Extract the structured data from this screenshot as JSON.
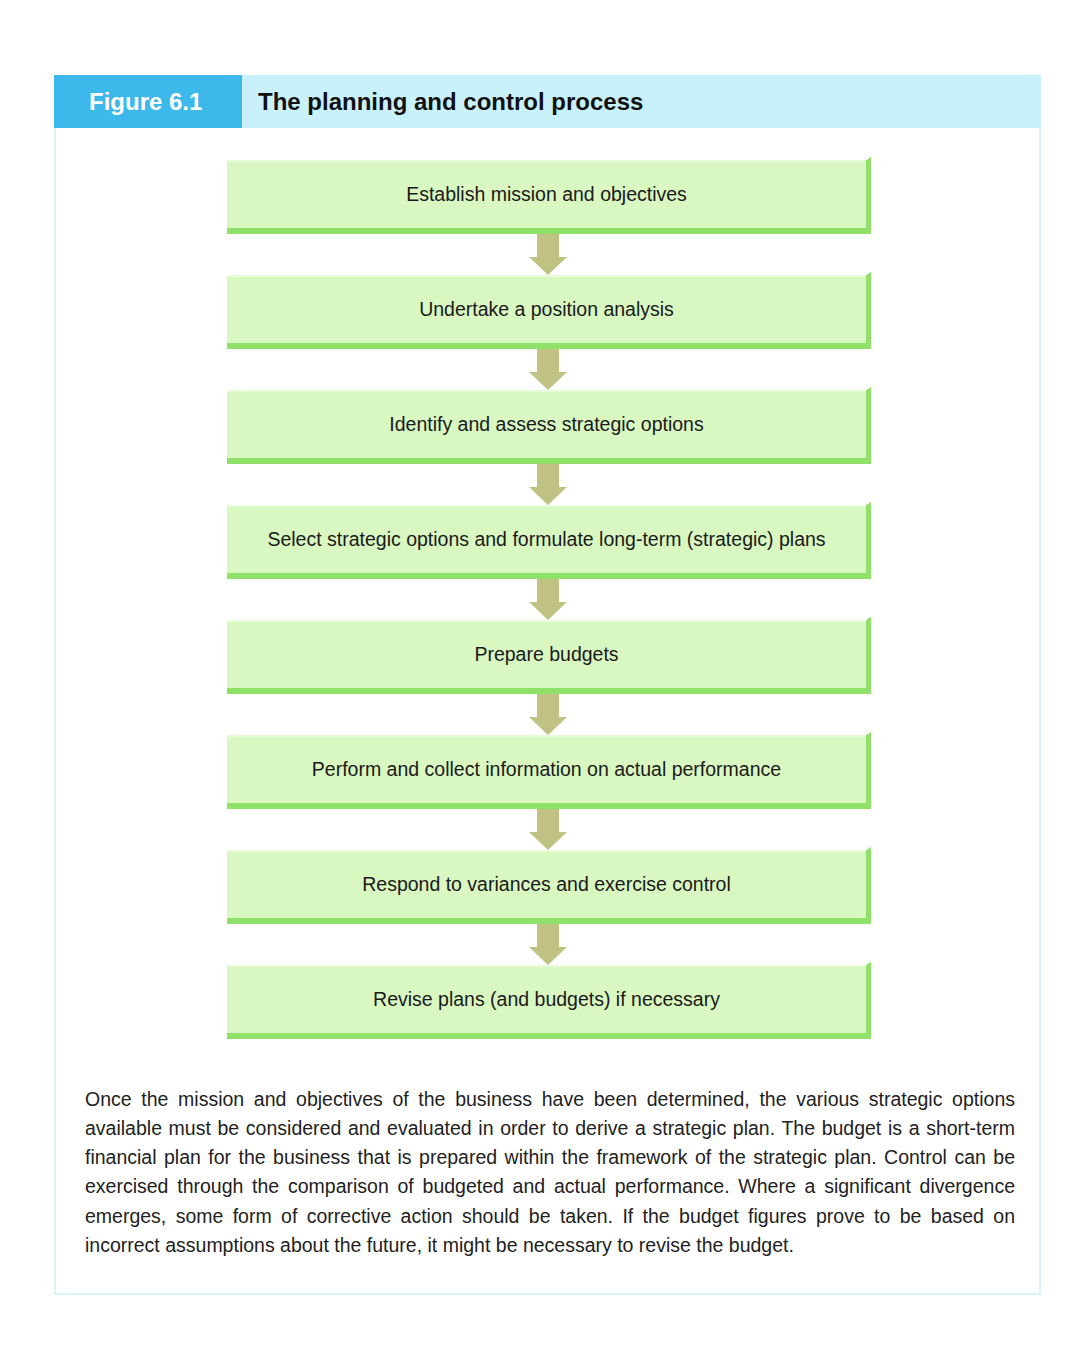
{
  "figure": {
    "number_label": "Figure 6.1",
    "title": "The planning and control process",
    "colors": {
      "label_bg": "#3cb8ea",
      "title_bg": "#c9f1fb",
      "box_fill": "#d9f7c0",
      "box_edge": "#8fe16a",
      "arrow": "#bfc283",
      "frame": "#d8f3fa"
    }
  },
  "flow": {
    "steps": [
      {
        "label": "Establish mission and objectives"
      },
      {
        "label": "Undertake a position analysis"
      },
      {
        "label": "Identify and assess strategic options"
      },
      {
        "label": "Select strategic options and formulate long-term (strategic) plans"
      },
      {
        "label": "Prepare budgets"
      },
      {
        "label": "Perform and collect information on actual performance"
      },
      {
        "label": "Respond to variances and exercise control"
      },
      {
        "label": "Revise plans (and budgets) if necessary"
      }
    ],
    "connector_icon": "down-arrow-icon"
  },
  "description": "Once the mission and objectives of the business have been determined, the various strategic options available must be considered and evaluated in order to derive a strategic plan. The budget is a short-term financial plan for the business that is prepared within the framework of the strategic plan. Control can be exercised through the comparison of budgeted and actual performance. Where a significant divergence emerges, some form of corrective action should be taken. If the budget figures prove to be based on incorrect assumptions about the future, it might be necessary to revise the budget."
}
